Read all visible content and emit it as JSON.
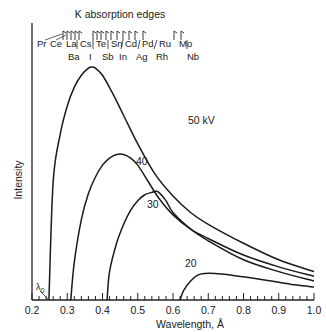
{
  "chart_data": {
    "type": "line",
    "title": "",
    "xlabel": "Wavelength, Å",
    "ylabel": "Intensity",
    "xlim": [
      0.2,
      1.0
    ],
    "ylim": [
      0,
      100
    ],
    "x_ticks": [
      "0.2",
      "0.3",
      "0.4",
      "0.5",
      "0.6",
      "0.7",
      "0.8",
      "0.9",
      "1.0"
    ],
    "grid": false,
    "legend": "inline curve labels",
    "annotations": {
      "top_label": "K absorption edges",
      "lambda_label": "λ0",
      "edges_row1": [
        "Pr",
        "Ce",
        "La",
        "Cs",
        "Te",
        "Sn",
        "Cd",
        "Pd",
        "Ru",
        "Mo"
      ],
      "edges_row2": [
        "Ba",
        "I",
        "Sb",
        "In",
        "Ag",
        "Rh",
        "Nb"
      ]
    },
    "series": [
      {
        "name": "50 kV",
        "label": "50 kV",
        "x": [
          0.248,
          0.26,
          0.28,
          0.3,
          0.32,
          0.34,
          0.36,
          0.37,
          0.38,
          0.4,
          0.43,
          0.46,
          0.5,
          0.55,
          0.6,
          0.65,
          0.7,
          0.8,
          0.9,
          1.0
        ],
        "y": [
          0,
          50,
          70,
          82,
          90,
          95,
          98,
          98.5,
          98,
          95,
          87,
          78,
          66,
          53,
          44,
          37,
          32,
          24,
          17,
          12
        ]
      },
      {
        "name": "40 kV",
        "label": "40",
        "x": [
          0.31,
          0.32,
          0.34,
          0.36,
          0.38,
          0.4,
          0.42,
          0.44,
          0.46,
          0.48,
          0.5,
          0.53,
          0.56,
          0.6,
          0.65,
          0.7,
          0.8,
          0.9,
          1.0
        ],
        "y": [
          0,
          16,
          34,
          45,
          52,
          57,
          60,
          61.5,
          61.5,
          60,
          57,
          50,
          43,
          36,
          30,
          26,
          19,
          14,
          10
        ]
      },
      {
        "name": "30 kV",
        "label": "30",
        "x": [
          0.413,
          0.42,
          0.44,
          0.46,
          0.48,
          0.5,
          0.52,
          0.54,
          0.55,
          0.56,
          0.58,
          0.6,
          0.65,
          0.7,
          0.8,
          0.9,
          1.0
        ],
        "y": [
          0,
          12,
          24,
          32,
          38,
          42,
          44.5,
          45.5,
          46,
          45.5,
          42,
          37,
          30,
          25,
          17,
          12,
          8
        ]
      },
      {
        "name": "20 kV",
        "label": "20",
        "x": [
          0.62,
          0.63,
          0.65,
          0.67,
          0.69,
          0.72,
          0.76,
          0.8,
          0.85,
          0.9,
          0.95,
          1.0
        ],
        "y": [
          0,
          4,
          8,
          10.5,
          11.2,
          11.2,
          10.6,
          9.8,
          8.7,
          7.5,
          6.3,
          5.5
        ]
      }
    ]
  }
}
